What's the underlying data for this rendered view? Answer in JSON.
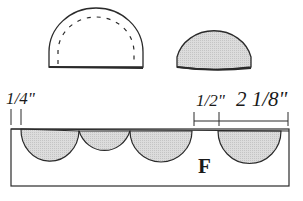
{
  "diagram": {
    "type": "sewing-pattern-layout",
    "shapes": {
      "top_left": {
        "name": "half-circle piece with dashed seam line",
        "fill": "#ffffff"
      },
      "top_right": {
        "name": "half-circle piece shaded",
        "fill": "#d9d9d9"
      }
    },
    "panel": {
      "label": "F",
      "scallop_count_left": 3,
      "scallop_count_right": 1,
      "scallop_fill": "#d9d9d9"
    },
    "dimensions": {
      "left_margin": "1/4\"",
      "gap": "1/2\"",
      "scallop_width": "2 1/8\""
    },
    "colors": {
      "line": "#2a2a2a",
      "shade": "#d9d9d9",
      "background": "#ffffff"
    }
  }
}
